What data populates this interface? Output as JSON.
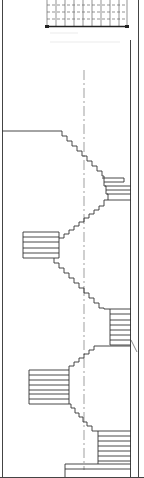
{
  "drawing": {
    "type": "stair-section",
    "stroke_color": "#333333",
    "grid_color": "#555555",
    "centerline_color": "#666666",
    "background": "#ffffff",
    "top_grid": {
      "x": 47,
      "y": 0,
      "width": 80,
      "height": 26,
      "cols": 9,
      "rows": 3
    },
    "frame": {
      "left_x": 2,
      "right_inner_x": 130,
      "right_outer_x": 138
    },
    "centerline_x": 84,
    "landings": [
      {
        "side": "left",
        "y": 131,
        "x1": 2,
        "x2": 62
      },
      {
        "side": "right",
        "y_top": 178,
        "y_bottom": 192,
        "x1": 104,
        "x2": 131,
        "treads": 4
      },
      {
        "side": "left",
        "y_top": 232,
        "y_bottom": 258,
        "x1": 23,
        "x2": 59,
        "treads": 6
      },
      {
        "side": "right",
        "y_top": 309,
        "y_bottom": 345,
        "x1": 110,
        "x2": 131,
        "treads": 7
      },
      {
        "side": "left",
        "y_top": 370,
        "y_bottom": 404,
        "x1": 29,
        "x2": 69,
        "treads": 7
      },
      {
        "side": "right",
        "y_top": 431,
        "y_bottom": 465,
        "x1": 98,
        "x2": 131,
        "treads": 6
      }
    ],
    "base": {
      "y1": 464,
      "y2": 477,
      "x1": 65,
      "x2": 131
    }
  }
}
